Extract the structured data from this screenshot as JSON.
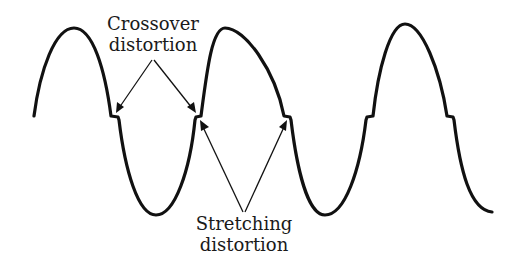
{
  "diagram": {
    "labels": {
      "crossover_line1": "Crossover",
      "crossover_line2": "distortion",
      "stretching_line1": "Stretching",
      "stretching_line2": "distortion"
    },
    "colors": {
      "waveform": "#111111",
      "text": "#1a1a1a",
      "background": "#ffffff"
    },
    "waveform": {
      "type": "distorted sine wave",
      "visible_cycles": 2.5,
      "features": [
        "crossover notches at zero crossings",
        "stretched slopes near zero crossings"
      ]
    }
  }
}
